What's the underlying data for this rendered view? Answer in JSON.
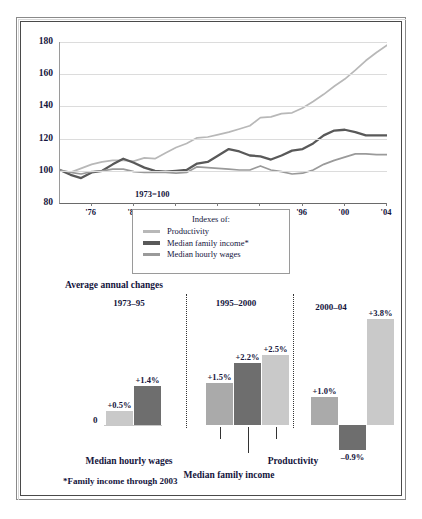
{
  "figure": {
    "footnote": "*Family income through 2003"
  },
  "colors": {
    "productivity": "#b8b8b8",
    "median_family_income": "#595959",
    "median_hourly_wages": "#9a9a9a",
    "bar_light": "#c9c9c9",
    "bar_mid": "#aaaaaa",
    "bar_dark": "#6e6e6e",
    "gridline": "#dcdcdc",
    "text": "#14143c"
  },
  "legend": {
    "title": "Indexes of:",
    "items": [
      {
        "label": "Productivity",
        "swatch": "productivity",
        "weight": "thin"
      },
      {
        "label": "Median family income*",
        "swatch": "median_family_income",
        "weight": "thick"
      },
      {
        "label": "Median hourly wages",
        "swatch": "median_hourly_wages",
        "weight": "thin"
      }
    ]
  },
  "chart_data": [
    {
      "type": "line",
      "title": "",
      "annotation": "1973=100",
      "xlabel": "",
      "ylabel": "",
      "ylim": [
        80,
        180
      ],
      "yticks": [
        80,
        100,
        120,
        140,
        160,
        180
      ],
      "xlim": [
        1973,
        2004
      ],
      "xticks": [
        1976,
        1980,
        1984,
        1988,
        1992,
        1996,
        2000,
        2004
      ],
      "xticklabels": [
        "'76",
        "'80",
        "'84",
        "'88",
        "'92",
        "'96",
        "'00",
        "'04"
      ],
      "grid": true,
      "legend_position": "below-center",
      "x": [
        1973,
        1974,
        1975,
        1976,
        1977,
        1978,
        1979,
        1980,
        1981,
        1982,
        1983,
        1984,
        1985,
        1986,
        1987,
        1988,
        1989,
        1990,
        1991,
        1992,
        1993,
        1994,
        1995,
        1996,
        1997,
        1998,
        1999,
        2000,
        2001,
        2002,
        2003,
        2004
      ],
      "series": [
        {
          "name": "Productivity",
          "color": "#b8b8b8",
          "values": [
            100.0,
            99.0,
            101.5,
            104.0,
            105.5,
            106.5,
            106.5,
            106.0,
            108.0,
            107.5,
            111.0,
            114.5,
            117.0,
            120.5,
            121.0,
            122.5,
            124.0,
            126.0,
            128.0,
            133.0,
            133.5,
            135.5,
            136.0,
            139.0,
            143.0,
            147.5,
            152.5,
            157.0,
            162.5,
            168.5,
            173.5,
            178.0
          ]
        },
        {
          "name": "Median family income*",
          "color": "#595959",
          "values": [
            100.5,
            97.5,
            95.5,
            99.0,
            100.0,
            104.0,
            107.5,
            105.0,
            102.0,
            100.0,
            99.5,
            100.0,
            100.5,
            104.5,
            105.5,
            109.5,
            113.5,
            112.0,
            109.5,
            109.0,
            107.0,
            109.5,
            112.5,
            113.5,
            117.0,
            122.0,
            125.0,
            125.5,
            124.0,
            122.0,
            122.0,
            122.0
          ]
        },
        {
          "name": "Median hourly wages",
          "color": "#9a9a9a",
          "values": [
            100.5,
            99.0,
            98.0,
            99.5,
            100.0,
            101.0,
            101.0,
            99.5,
            99.0,
            99.0,
            99.0,
            98.5,
            99.0,
            102.5,
            102.0,
            101.5,
            101.0,
            100.5,
            100.5,
            103.0,
            100.5,
            99.5,
            98.0,
            98.5,
            100.5,
            104.0,
            106.5,
            108.5,
            110.5,
            110.5,
            110.0,
            110.0
          ]
        }
      ]
    },
    {
      "type": "bar",
      "title": "Average annual changes",
      "ylabel": "",
      "zero_label": "0",
      "ylim": [
        -1.2,
        4.2
      ],
      "groups": [
        {
          "label": "1973–95",
          "bars": [
            {
              "series": "Median hourly wages",
              "value": 0.5,
              "label": "+0.5%",
              "color": "bar_light"
            },
            {
              "series": "Productivity",
              "value": 1.4,
              "label": "+1.4%",
              "color": "bar_dark"
            }
          ]
        },
        {
          "label": "1995–2000",
          "bars": [
            {
              "series": "Median hourly wages",
              "value": 1.5,
              "label": "+1.5%",
              "color": "bar_mid"
            },
            {
              "series": "Median family income",
              "value": 2.2,
              "label": "+2.2%",
              "color": "bar_dark"
            },
            {
              "series": "Productivity",
              "value": 2.5,
              "label": "+2.5%",
              "color": "bar_light"
            }
          ]
        },
        {
          "label": "2000–04",
          "bars": [
            {
              "series": "Median hourly wages",
              "value": 1.0,
              "label": "+1.0%",
              "color": "bar_mid"
            },
            {
              "series": "Median family income",
              "value": -0.9,
              "label": "–0.9%",
              "color": "bar_dark"
            },
            {
              "series": "Productivity",
              "value": 3.8,
              "label": "+3.8%",
              "color": "bar_light"
            }
          ]
        }
      ],
      "series_callouts": [
        {
          "label": "Median hourly wages"
        },
        {
          "label": "Median family income"
        },
        {
          "label": "Productivity"
        }
      ]
    }
  ]
}
